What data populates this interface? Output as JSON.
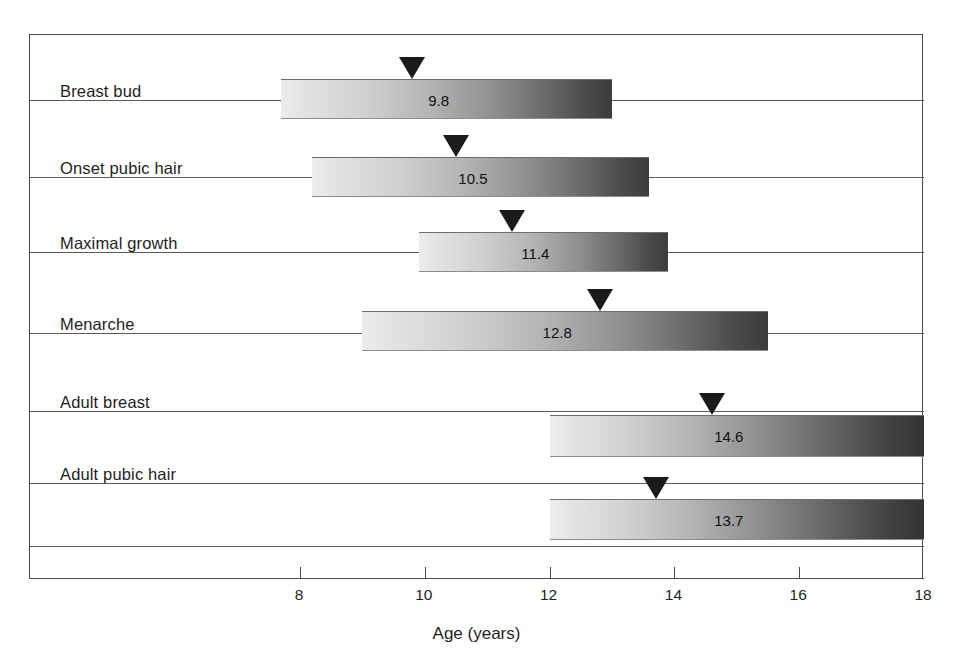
{
  "chart_data": {
    "type": "bar",
    "subtype": "range-bar-with-mean-marker",
    "title": "",
    "xlabel": "Age (years)",
    "ylabel": "",
    "xlim": [
      6.0,
      18.0
    ],
    "xticks": [
      8,
      10,
      12,
      14,
      16,
      18
    ],
    "xtick_labels": [
      "8",
      "10",
      "12",
      "14",
      "16",
      "18"
    ],
    "grid": false,
    "legend": null,
    "categories": [
      "Breast bud",
      "Onset pubic hair",
      "Maximal growth",
      "Menarche",
      "Adult breast",
      "Adult pubic hair"
    ],
    "series": [
      {
        "name": "Age range",
        "ranges": [
          [
            7.7,
            13.0
          ],
          [
            8.2,
            13.6
          ],
          [
            9.9,
            13.9
          ],
          [
            9.0,
            15.5
          ],
          [
            12.0,
            18.0
          ],
          [
            12.0,
            18.0
          ]
        ]
      },
      {
        "name": "Mean age (marker)",
        "values": [
          9.8,
          10.5,
          11.4,
          12.8,
          14.6,
          13.7
        ]
      }
    ],
    "value_labels": [
      "9.8",
      "10.5",
      "11.4",
      "12.8",
      "14.6",
      "13.7"
    ],
    "bar_style": "horizontal gradient, light grey at left to dark grey at right",
    "marker_style": "black downward triangle above bar at mean age"
  },
  "axis": {
    "title": "Age (years)",
    "ticks": [
      {
        "label": "8",
        "value": 8
      },
      {
        "label": "10",
        "value": 10
      },
      {
        "label": "12",
        "value": 12
      },
      {
        "label": "14",
        "value": 14
      },
      {
        "label": "16",
        "value": 16
      },
      {
        "label": "18",
        "value": 18
      }
    ]
  },
  "rows": [
    {
      "label": "Breast bud",
      "value_label": "9.8",
      "start": 7.7,
      "end": 13.0,
      "marker": 9.8
    },
    {
      "label": "Onset pubic hair",
      "value_label": "10.5",
      "start": 8.2,
      "end": 13.6,
      "marker": 10.5
    },
    {
      "label": "Maximal growth",
      "value_label": "11.4",
      "start": 9.9,
      "end": 13.9,
      "marker": 11.4
    },
    {
      "label": "Menarche",
      "value_label": "12.8",
      "start": 9.0,
      "end": 15.5,
      "marker": 12.8
    },
    {
      "label": "Adult breast",
      "value_label": "14.6",
      "start": 12.0,
      "end": 18.0,
      "marker": 14.6
    },
    {
      "label": "Adult pubic hair",
      "value_label": "13.7",
      "start": 12.0,
      "end": 18.0,
      "marker": 13.7
    }
  ],
  "colors": {
    "frame": "#4a4a4a",
    "rule": "#5a5a5a",
    "bar_light": "#ededee",
    "bar_dark": "#343435",
    "marker": "#1b1b1b",
    "text": "#1e1e1e",
    "background": "#ffffff"
  }
}
